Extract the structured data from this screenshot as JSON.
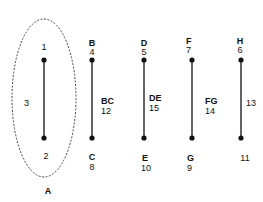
{
  "diagram": {
    "background": "#ffffff",
    "stroke_color": "#111111",
    "ellipse": {
      "label": "A",
      "style": "dashed",
      "cx": 44,
      "cy": 98,
      "rx": 32,
      "ry": 79
    },
    "segments": [
      {
        "id": "seg-1",
        "x": 44,
        "y1": 60,
        "y2": 138,
        "top": {
          "letter": "",
          "number": "1"
        },
        "bottom": {
          "letter": "",
          "number": "2"
        },
        "edge": {
          "letter": "",
          "number": "3"
        }
      },
      {
        "id": "seg-bc",
        "x": 92,
        "y1": 60,
        "y2": 138,
        "top": {
          "letter": "B",
          "number": "4"
        },
        "bottom": {
          "letter": "C",
          "number": "8"
        },
        "edge": {
          "letter": "BC",
          "number": "12"
        }
      },
      {
        "id": "seg-de",
        "x": 144,
        "y1": 60,
        "y2": 138,
        "top": {
          "letter": "D",
          "number": "5"
        },
        "bottom": {
          "letter": "E",
          "number": "10"
        },
        "edge": {
          "letter": "DE",
          "number": "15"
        }
      },
      {
        "id": "seg-fg",
        "x": 192,
        "y1": 60,
        "y2": 138,
        "top": {
          "letter": "F",
          "number": "7"
        },
        "bottom": {
          "letter": "G",
          "number": "9"
        },
        "edge": {
          "letter": "FG",
          "number": "14"
        }
      },
      {
        "id": "seg-h",
        "x": 241,
        "y1": 60,
        "y2": 138,
        "top": {
          "letter": "H",
          "number": "6"
        },
        "bottom": {
          "letter": "",
          "number": "11"
        },
        "edge": {
          "letter": "",
          "number": "13"
        }
      }
    ]
  }
}
